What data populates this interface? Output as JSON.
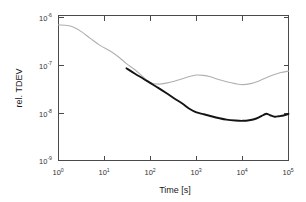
{
  "chart_data": {
    "type": "line",
    "title": "",
    "xlabel": "Time [s]",
    "ylabel": "rel. TDEV",
    "xscale": "log",
    "yscale": "log",
    "xlim": [
      1,
      100000
    ],
    "ylim": [
      1e-09,
      1e-06
    ],
    "grid": false,
    "legend": "none",
    "xticks": [
      1,
      10,
      100,
      1000,
      10000,
      100000
    ],
    "xtick_labels": [
      "10^0",
      "10^1",
      "10^2",
      "10^3",
      "10^4",
      "10^5"
    ],
    "yticks": [
      1e-09,
      1e-08,
      1e-07,
      1e-06
    ],
    "ytick_labels": [
      "10^-9",
      "10^-8",
      "10^-7",
      "10^-6"
    ],
    "series": [
      {
        "name": "light-gray-curve",
        "color": "#b0b0b0",
        "linewidth": 1.1,
        "x": [
          1,
          1.6,
          2.2,
          3.2,
          5,
          8,
          13,
          20,
          30,
          46,
          70,
          100,
          150,
          220,
          330,
          500,
          700,
          1000,
          1400,
          2000,
          3000,
          4500,
          7000,
          10000,
          15000,
          22000,
          32000,
          46000,
          68000,
          100000
        ],
        "y": [
          7e-07,
          6.8e-07,
          6.2e-07,
          5e-07,
          3.6e-07,
          2.6e-07,
          2e-07,
          1.5e-07,
          1.08e-07,
          8e-08,
          5.6e-08,
          4.3e-08,
          4e-08,
          4.2e-08,
          4.6e-08,
          5.2e-08,
          5.8e-08,
          6.2e-08,
          6.1e-08,
          5.7e-08,
          5e-08,
          4.5e-08,
          4.1e-08,
          3.9e-08,
          4.1e-08,
          4.6e-08,
          5.4e-08,
          6.2e-08,
          7e-08,
          7.5e-08
        ]
      },
      {
        "name": "dark-black-curve",
        "color": "#141414",
        "linewidth": 1.9,
        "x": [
          30,
          46,
          70,
          100,
          150,
          220,
          330,
          500,
          700,
          1000,
          1400,
          2000,
          3000,
          4500,
          7000,
          10000,
          14000,
          20000,
          28000,
          33000,
          40000,
          50000,
          62000,
          78000,
          100000
        ],
        "y": [
          8.6e-08,
          6.6e-08,
          5.2e-08,
          4.2e-08,
          3.3e-08,
          2.6e-08,
          2e-08,
          1.55e-08,
          1.22e-08,
          1.02e-08,
          9.4e-09,
          8.6e-09,
          7.8e-09,
          7.2e-09,
          6.9e-09,
          6.8e-09,
          7e-09,
          7.6e-09,
          8.9e-09,
          9.6e-09,
          8.9e-09,
          8.3e-09,
          8.5e-09,
          8.8e-09,
          9.5e-09
        ]
      }
    ]
  },
  "axes": {
    "ylabel": "rel. TDEV",
    "xlabel": "Time [s]",
    "x_tick_mantissa": "10",
    "xtick_exponents": [
      "0",
      "1",
      "2",
      "3",
      "4",
      "5"
    ],
    "ytick_exponents": [
      "-6",
      "-7",
      "-8",
      "-9"
    ]
  }
}
